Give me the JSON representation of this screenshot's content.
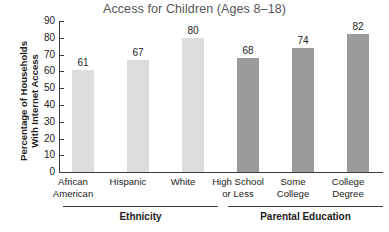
{
  "chart_data": {
    "type": "bar",
    "title": "Access for Children (Ages 8–18)",
    "xlabel": "",
    "ylabel": "Percentage of Households With Internet Access",
    "ylabel_lines": [
      "Percentage of Households",
      "With Internet Access"
    ],
    "ylim": [
      0,
      90
    ],
    "ytick_step": 10,
    "yticks": [
      "90",
      "80",
      "70",
      "60",
      "50",
      "40",
      "30",
      "20",
      "10",
      "0"
    ],
    "grid": false,
    "legend": "none",
    "categories": [
      "African American",
      "Hispanic",
      "White",
      "High School or Less",
      "Some College",
      "College Degree"
    ],
    "category_lines": [
      [
        "African",
        "American"
      ],
      [
        "Hispanic"
      ],
      [
        "White"
      ],
      [
        "High School",
        "or Less"
      ],
      [
        "Some",
        "College"
      ],
      [
        "College",
        "Degree"
      ]
    ],
    "values": [
      61,
      67,
      80,
      68,
      74,
      82
    ],
    "value_labels": [
      "61",
      "67",
      "80",
      "68",
      "74",
      "82"
    ],
    "bar_colors": [
      "#dcdcdc",
      "#dcdcdc",
      "#dcdcdc",
      "#9b9b9b",
      "#9b9b9b",
      "#9b9b9b"
    ],
    "groups": [
      {
        "title": "Ethnicity",
        "members": [
          "African American",
          "Hispanic",
          "White"
        ]
      },
      {
        "title": "Parental Education",
        "members": [
          "High School or Less",
          "Some College",
          "College Degree"
        ]
      }
    ],
    "colors": {
      "light_bar": "#dcdcdc",
      "dark_bar": "#9b9b9b",
      "axis": "#3b3b3b",
      "title_text": "#565656",
      "text": "#1d1d1d",
      "background": "#ffffff"
    }
  }
}
